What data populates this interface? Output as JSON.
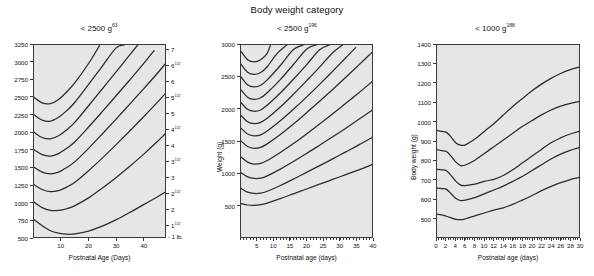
{
  "figure": {
    "title": "Body weight category"
  },
  "panels": [
    {
      "id": "panel-left",
      "title_prefix": "< 2500 g",
      "title_ref": "63",
      "xlabel": "Postnatal Age (Days)",
      "ylabel": "",
      "ylim": [
        500,
        3250
      ],
      "xlim": [
        0,
        48
      ],
      "yticks": [
        500,
        750,
        1000,
        1250,
        1500,
        1750,
        2000,
        2250,
        2500,
        2750,
        3000,
        3250
      ],
      "ytick_labels": [
        "500",
        "750",
        "1000",
        "1250",
        "1500",
        "1750",
        "2000",
        "2250",
        "2500",
        "2750",
        "3000",
        "3250"
      ],
      "xticks": [
        10,
        20,
        30,
        40
      ],
      "xtick_labels": [
        "10",
        "20",
        "30",
        "40"
      ],
      "right_axis_label": "- 1 lb.",
      "right_ticks": [
        {
          "value": 3175,
          "label": "7",
          "half": ""
        },
        {
          "value": 2948,
          "label": "6",
          "half": "1/2"
        },
        {
          "value": 2722,
          "label": "6",
          "half": ""
        },
        {
          "value": 2495,
          "label": "5",
          "half": "1/2"
        },
        {
          "value": 2268,
          "label": "5",
          "half": ""
        },
        {
          "value": 2041,
          "label": "4",
          "half": "1/2"
        },
        {
          "value": 1814,
          "label": "4",
          "half": ""
        },
        {
          "value": 1588,
          "label": "3",
          "half": "1/2"
        },
        {
          "value": 1361,
          "label": "3",
          "half": ""
        },
        {
          "value": 1134,
          "label": "2",
          "half": "1/2"
        },
        {
          "value": 907,
          "label": "2",
          "half": ""
        },
        {
          "value": 680,
          "label": "1",
          "half": "1/2"
        }
      ]
    },
    {
      "id": "panel-middle",
      "title_prefix": "< 2500 g",
      "title_ref": "196",
      "xlabel": "Postnatal age (days)",
      "ylabel": "Weight (g)",
      "ylim": [
        0,
        3000
      ],
      "xlim": [
        0,
        40
      ],
      "yticks": [
        500,
        1000,
        1500,
        2000,
        2500,
        3000
      ],
      "ytick_labels": [
        "500",
        "1000",
        "1500",
        "2000",
        "2500",
        "3000"
      ],
      "xticks": [
        5,
        10,
        15,
        20,
        25,
        30,
        35,
        40
      ],
      "xtick_labels": [
        "5",
        "10",
        "15",
        "20",
        "25",
        "30",
        "35",
        "40"
      ]
    },
    {
      "id": "panel-right",
      "title_prefix": "< 1000 g",
      "title_ref": "188",
      "xlabel": "Postnatal age (days)",
      "ylabel": "Body weight (g)",
      "ylim": [
        400,
        1400
      ],
      "xlim": [
        0,
        30
      ],
      "yticks": [
        500,
        600,
        700,
        800,
        900,
        1000,
        1100,
        1200,
        1300,
        1400
      ],
      "ytick_labels": [
        "500",
        "600",
        "700",
        "800",
        "900",
        "1000",
        "1100",
        "1200",
        "1300",
        "1400"
      ],
      "xticks": [
        0,
        2,
        4,
        6,
        8,
        10,
        12,
        14,
        16,
        18,
        20,
        22,
        24,
        26,
        28,
        30
      ],
      "xtick_labels": [
        "0",
        "2",
        "4",
        "6",
        "8",
        "10",
        "12",
        "14",
        "16",
        "18",
        "20",
        "22",
        "24",
        "26",
        "28",
        "30"
      ]
    }
  ],
  "chart_data": [
    {
      "type": "line",
      "panel": "panel-left",
      "title": "< 2500 g",
      "xlabel": "Postnatal Age (Days)",
      "ylabel": "",
      "xlim": [
        0,
        48
      ],
      "ylim": [
        500,
        3250
      ],
      "grid": false,
      "legend": "none",
      "note": "Neonatal growth curves (Dancis): weight vs postnatal age, one curve per birth-weight group",
      "series": [
        {
          "name": "birth weight 750 g",
          "x": [
            0,
            3,
            6,
            9,
            12,
            15,
            20,
            25,
            30,
            35,
            40,
            45,
            48
          ],
          "y": [
            750,
            660,
            590,
            555,
            540,
            545,
            585,
            655,
            745,
            850,
            960,
            1070,
            1140
          ]
        },
        {
          "name": "birth weight 1000 g",
          "x": [
            0,
            3,
            6,
            9,
            12,
            15,
            20,
            25,
            30,
            35,
            40,
            45,
            48
          ],
          "y": [
            1000,
            920,
            880,
            880,
            905,
            950,
            1060,
            1200,
            1350,
            1510,
            1680,
            1860,
            1975
          ]
        },
        {
          "name": "birth weight 1250 g",
          "x": [
            0,
            3,
            6,
            9,
            12,
            15,
            20,
            25,
            30,
            35,
            40,
            45,
            48
          ],
          "y": [
            1250,
            1180,
            1150,
            1165,
            1215,
            1285,
            1450,
            1630,
            1820,
            2015,
            2215,
            2420,
            2550
          ]
        },
        {
          "name": "birth weight 1500 g",
          "x": [
            0,
            3,
            6,
            9,
            12,
            15,
            20,
            25,
            30,
            35,
            40,
            45,
            48
          ],
          "y": [
            1500,
            1430,
            1405,
            1430,
            1495,
            1580,
            1770,
            1975,
            2185,
            2400,
            2615,
            2835,
            2975
          ]
        },
        {
          "name": "birth weight 1750 g",
          "x": [
            0,
            3,
            6,
            9,
            12,
            15,
            20,
            25,
            30,
            35,
            40,
            44
          ],
          "y": [
            1750,
            1680,
            1660,
            1695,
            1770,
            1865,
            2075,
            2295,
            2520,
            2745,
            2975,
            3170
          ]
        },
        {
          "name": "birth weight 2000 g",
          "x": [
            0,
            3,
            6,
            9,
            12,
            15,
            20,
            25,
            30,
            35,
            38
          ],
          "y": [
            2000,
            1925,
            1905,
            1950,
            2035,
            2145,
            2380,
            2620,
            2860,
            3105,
            3250
          ]
        },
        {
          "name": "birth weight 2250 g",
          "x": [
            0,
            3,
            6,
            9,
            12,
            15,
            20,
            25,
            30,
            33
          ],
          "y": [
            2250,
            2175,
            2160,
            2215,
            2310,
            2430,
            2685,
            2945,
            3205,
            3250
          ]
        },
        {
          "name": "birth weight 2500 g",
          "x": [
            0,
            3,
            6,
            9,
            12,
            15,
            20,
            24
          ],
          "y": [
            2500,
            2420,
            2410,
            2470,
            2580,
            2710,
            2985,
            3240,
            3250
          ]
        }
      ]
    },
    {
      "type": "line",
      "panel": "panel-middle",
      "title": "< 2500 g",
      "xlabel": "Postnatal age (days)",
      "ylabel": "Weight (g)",
      "xlim": [
        0,
        40
      ],
      "ylim": [
        0,
        3000
      ],
      "grid": false,
      "legend": "none",
      "note": "Growth curves for infants < 2500 g; curves dip to a nadir near day 5-7 then rise",
      "series": [
        {
          "name": "500 g",
          "x": [
            0,
            2,
            4,
            6,
            8,
            12,
            16,
            20,
            24,
            28,
            32,
            36,
            40
          ],
          "y": [
            520,
            500,
            495,
            505,
            530,
            600,
            675,
            750,
            825,
            900,
            975,
            1050,
            1130
          ]
        },
        {
          "name": "750 g",
          "x": [
            0,
            2,
            4,
            6,
            8,
            12,
            16,
            20,
            24,
            28,
            32,
            36,
            40
          ],
          "y": [
            760,
            700,
            680,
            685,
            715,
            805,
            905,
            1010,
            1115,
            1220,
            1330,
            1440,
            1555
          ]
        },
        {
          "name": "1000 g",
          "x": [
            0,
            2,
            4,
            6,
            8,
            12,
            16,
            20,
            24,
            28,
            32,
            36,
            40
          ],
          "y": [
            1005,
            940,
            915,
            920,
            955,
            1060,
            1180,
            1305,
            1435,
            1565,
            1700,
            1840,
            1980
          ]
        },
        {
          "name": "1250 g",
          "x": [
            0,
            2,
            4,
            6,
            8,
            12,
            16,
            20,
            24,
            28,
            32,
            36,
            40
          ],
          "y": [
            1250,
            1170,
            1140,
            1150,
            1195,
            1320,
            1460,
            1610,
            1765,
            1925,
            2090,
            2255,
            2425
          ]
        },
        {
          "name": "1500 g",
          "x": [
            0,
            2,
            4,
            6,
            8,
            12,
            16,
            20,
            24,
            28,
            32,
            36,
            40
          ],
          "y": [
            1500,
            1415,
            1385,
            1400,
            1455,
            1600,
            1765,
            1940,
            2120,
            2305,
            2495,
            2690,
            2885
          ]
        },
        {
          "name": "1700 g",
          "x": [
            0,
            2,
            4,
            6,
            8,
            12,
            16,
            20,
            24,
            28,
            32,
            35
          ],
          "y": [
            1700,
            1610,
            1580,
            1595,
            1655,
            1815,
            1995,
            2185,
            2385,
            2590,
            2800,
            2960
          ]
        },
        {
          "name": "1900 g",
          "x": [
            0,
            2,
            4,
            6,
            8,
            12,
            16,
            20,
            24,
            28,
            31
          ],
          "y": [
            1900,
            1800,
            1770,
            1790,
            1855,
            2030,
            2230,
            2440,
            2655,
            2880,
            3000
          ]
        },
        {
          "name": "2100 g",
          "x": [
            0,
            2,
            4,
            6,
            8,
            12,
            16,
            20,
            24,
            27
          ],
          "y": [
            2100,
            1995,
            1965,
            1985,
            2060,
            2250,
            2465,
            2690,
            2925,
            3000
          ]
        },
        {
          "name": "2300 g",
          "x": [
            0,
            2,
            4,
            6,
            8,
            12,
            16,
            20,
            23
          ],
          "y": [
            2300,
            2185,
            2150,
            2175,
            2255,
            2460,
            2695,
            2935,
            3000
          ]
        },
        {
          "name": "2500 g",
          "x": [
            0,
            2,
            4,
            6,
            8,
            12,
            16,
            19
          ],
          "y": [
            2500,
            2380,
            2345,
            2370,
            2455,
            2680,
            2930,
            3000
          ]
        },
        {
          "name": "2700 g",
          "x": [
            0,
            2,
            4,
            6,
            8,
            11,
            14
          ],
          "y": [
            2700,
            2575,
            2540,
            2570,
            2660,
            2865,
            3000
          ]
        },
        {
          "name": "2900 g",
          "x": [
            0,
            2,
            4,
            6,
            8,
            9
          ],
          "y": [
            2900,
            2770,
            2735,
            2770,
            2870,
            3000
          ]
        }
      ]
    },
    {
      "type": "line",
      "panel": "panel-right",
      "title": "< 1000 g",
      "xlabel": "Postnatal age (days)",
      "ylabel": "Body weight (g)",
      "xlim": [
        0,
        30
      ],
      "ylim": [
        400,
        1400
      ],
      "grid": false,
      "legend": "none",
      "note": "ELBW growth curves (< 1000 g): each curve shows a brief plateau, a drop to nadir near day 5-6, then steady gain",
      "series": [
        {
          "name": "950 g",
          "x": [
            0,
            1,
            2,
            3,
            4,
            5,
            6,
            8,
            10,
            12,
            14,
            16,
            18,
            20,
            22,
            24,
            26,
            28,
            30
          ],
          "y": [
            955,
            950,
            945,
            920,
            890,
            878,
            880,
            910,
            950,
            990,
            1035,
            1080,
            1120,
            1160,
            1195,
            1225,
            1250,
            1270,
            1285
          ]
        },
        {
          "name": "850 g",
          "x": [
            0,
            1,
            2,
            3,
            4,
            5,
            6,
            8,
            10,
            12,
            14,
            16,
            18,
            20,
            22,
            24,
            26,
            28,
            30
          ],
          "y": [
            855,
            850,
            845,
            820,
            790,
            772,
            775,
            800,
            835,
            870,
            905,
            940,
            975,
            1005,
            1035,
            1060,
            1080,
            1095,
            1105
          ]
        },
        {
          "name": "750 g",
          "x": [
            0,
            1,
            2,
            3,
            4,
            5,
            6,
            8,
            10,
            12,
            14,
            16,
            18,
            20,
            22,
            24,
            26,
            28,
            30
          ],
          "y": [
            752,
            750,
            745,
            720,
            690,
            670,
            668,
            675,
            690,
            700,
            720,
            750,
            785,
            820,
            855,
            890,
            915,
            935,
            950
          ]
        },
        {
          "name": "650 g",
          "x": [
            0,
            1,
            2,
            3,
            4,
            5,
            6,
            8,
            10,
            12,
            14,
            16,
            18,
            20,
            22,
            24,
            26,
            28,
            30
          ],
          "y": [
            655,
            652,
            648,
            625,
            600,
            590,
            592,
            605,
            625,
            645,
            665,
            690,
            715,
            745,
            775,
            805,
            830,
            850,
            865
          ]
        },
        {
          "name": "520 g",
          "x": [
            0,
            1,
            2,
            3,
            4,
            5,
            6,
            8,
            10,
            12,
            14,
            16,
            18,
            20,
            22,
            24,
            26,
            28,
            30
          ],
          "y": [
            518,
            515,
            508,
            500,
            492,
            490,
            495,
            510,
            525,
            540,
            552,
            570,
            592,
            615,
            640,
            662,
            682,
            698,
            710
          ]
        }
      ]
    }
  ]
}
